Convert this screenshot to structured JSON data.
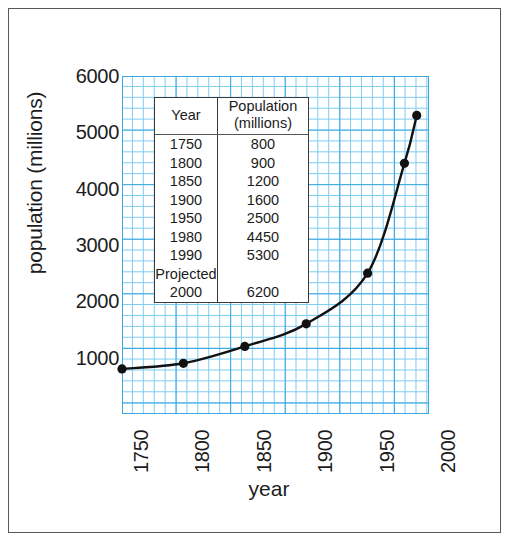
{
  "chart_data": {
    "type": "line",
    "title": "",
    "xlabel": "year",
    "ylabel": "population (millions)",
    "x": [
      1750,
      1800,
      1850,
      1900,
      1950,
      1980,
      1990
    ],
    "values": [
      800,
      900,
      1200,
      1600,
      2500,
      4450,
      5300
    ],
    "xlim": [
      1750,
      2000
    ],
    "ylim": [
      0,
      6000
    ],
    "xticks": [
      "1750",
      "1800",
      "1850",
      "1900",
      "1950",
      "2000"
    ],
    "xtick_values": [
      1750,
      1800,
      1850,
      1900,
      1950,
      2000
    ],
    "yticks": [
      "1000",
      "2000",
      "3000",
      "4000",
      "5000",
      "6000"
    ],
    "ytick_values": [
      1000,
      2000,
      3000,
      4000,
      5000,
      6000
    ],
    "grid": true,
    "grid_color": "#7ecbf0",
    "grid_major_color": "#3aa9e0",
    "line_color": "#111111",
    "marker": "circle",
    "marker_color": "#111111",
    "legend": "none"
  },
  "table": {
    "headers": {
      "year": "Year",
      "population_line1": "Population",
      "population_line2": "(millions)"
    },
    "rows": [
      {
        "year": "1750",
        "population": "800"
      },
      {
        "year": "1800",
        "population": "900"
      },
      {
        "year": "1850",
        "population": "1200"
      },
      {
        "year": "1900",
        "population": "1600"
      },
      {
        "year": "1950",
        "population": "2500"
      },
      {
        "year": "1980",
        "population": "4450"
      },
      {
        "year": "1990",
        "population": "5300"
      }
    ],
    "projected_label": "Projected",
    "projected_row": {
      "year": "2000",
      "population": "6200"
    }
  }
}
